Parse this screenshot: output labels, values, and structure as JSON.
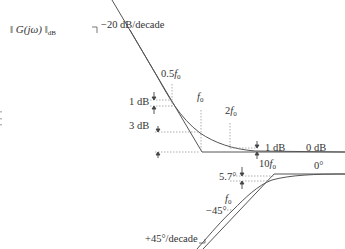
{
  "magnitude_plot": {
    "ylabel_main": "‖ G(jω) ‖",
    "ylabel_sub": "dB",
    "slope_label": "−20 dB/decade",
    "freq_markers": [
      {
        "coef": "0.5",
        "sym": "f",
        "sub": "0"
      },
      {
        "coef": "",
        "sym": "f",
        "sub": "0"
      },
      {
        "coef": "2",
        "sym": "f",
        "sub": "0"
      }
    ],
    "deviation_labels": {
      "at_half_f0": "1 dB",
      "at_f0": "3 dB",
      "at_2f0": "1 dB"
    },
    "high_freq_level": "0 dB"
  },
  "phase_plot": {
    "slope_label": "+45°/decade",
    "f0_marker": {
      "sym": "f",
      "sub": "0"
    },
    "f0_value": "−45°",
    "ten_f0_marker": {
      "coef": "10",
      "sym": "f",
      "sub": "0"
    },
    "deviation_label": "5.7°",
    "high_freq_level": "0°"
  },
  "colors": {
    "line": "#555555",
    "dotted": "#888888",
    "text": "#333333"
  }
}
